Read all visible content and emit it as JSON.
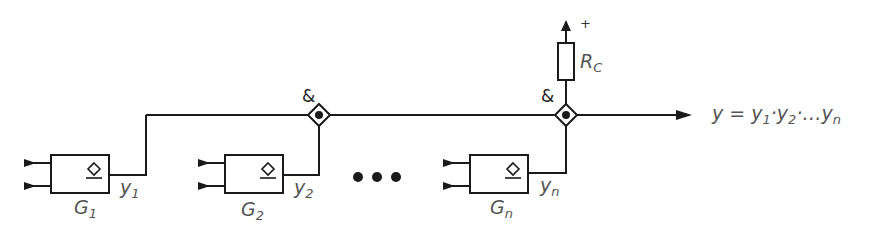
{
  "diagram": {
    "type": "wired-AND open-collector circuit",
    "gates": [
      {
        "id": "G1",
        "name": "G",
        "sub": "1",
        "output": "y",
        "output_sub": "1"
      },
      {
        "id": "G2",
        "name": "G",
        "sub": "2",
        "output": "y",
        "output_sub": "2"
      },
      {
        "id": "Gn",
        "name": "G",
        "sub": "n",
        "output": "y",
        "output_sub": "n"
      }
    ],
    "ellipsis": "•••",
    "nodes": [
      {
        "label": "&"
      },
      {
        "label": "&"
      }
    ],
    "resistor": {
      "name": "R",
      "sub": "C",
      "supply": "+"
    },
    "output_expression": {
      "lhs": "y =",
      "t1": "y",
      "t1_sub": "1",
      "dot1": "·",
      "t2": "y",
      "t2_sub": "2",
      "dot2": "·…",
      "t3": "y",
      "t3_sub": "n"
    },
    "colors": {
      "line": "#1a1a1a",
      "label": "#555555"
    }
  }
}
